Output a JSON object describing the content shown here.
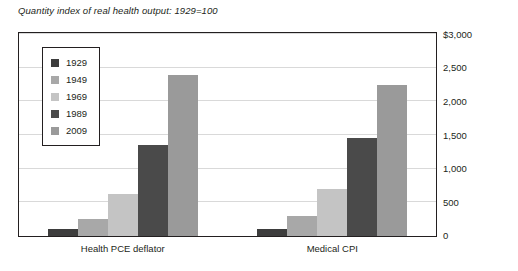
{
  "chart_data": {
    "type": "bar",
    "title": "Quantity index of real health output: 1929=100",
    "xlabel": "",
    "ylabel": "",
    "categories": [
      "Health PCE deflator",
      "Medical CPI"
    ],
    "series": [
      {
        "name": "1929",
        "color": "#3d3d3d",
        "values": [
          100,
          100
        ]
      },
      {
        "name": "1949",
        "color": "#a8a8a8",
        "values": [
          250,
          300
        ]
      },
      {
        "name": "1969",
        "color": "#c4c4c4",
        "values": [
          620,
          700
        ]
      },
      {
        "name": "1989",
        "color": "#4a4a4a",
        "values": [
          1350,
          1450
        ]
      },
      {
        "name": "2009",
        "color": "#9a9a9a",
        "values": [
          2400,
          2250
        ]
      }
    ],
    "ylim": [
      0,
      3000
    ],
    "yticks": [
      0,
      500,
      1000,
      1500,
      2000,
      2500,
      3000
    ],
    "ytick_labels": [
      "0",
      "500",
      "1,000",
      "1,500",
      "2,000",
      "2,500",
      "$3,000"
    ],
    "grid": true,
    "legend_position": "inside-top-left"
  },
  "legend": {
    "items": [
      {
        "label": "1929"
      },
      {
        "label": "1949"
      },
      {
        "label": "1969"
      },
      {
        "label": "1989"
      },
      {
        "label": "2009"
      }
    ]
  }
}
